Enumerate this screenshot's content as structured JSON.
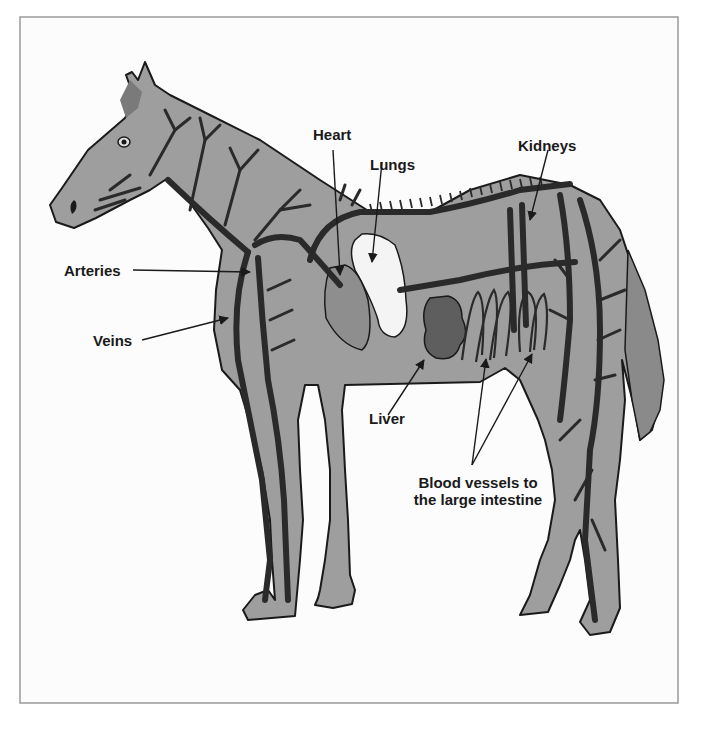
{
  "diagram": {
    "colors": {
      "background": "#fcfcfc",
      "frame_border": "#9a9a9a",
      "body_fill": "#9e9e9e",
      "vessel_fill": "#6e6e6e",
      "outline": "#1a1a1a",
      "lung_fill": "#f4f4f4",
      "liver_fill": "#5e5e5e",
      "label_text": "#1a1a1a"
    },
    "labels": {
      "heart": "Heart",
      "lungs": "Lungs",
      "kidneys": "Kidneys",
      "arteries": "Arteries",
      "veins": "Veins",
      "liver": "Liver",
      "blood_vessels_line1": "Blood vessels to",
      "blood_vessels_line2": "the large intestine"
    }
  }
}
